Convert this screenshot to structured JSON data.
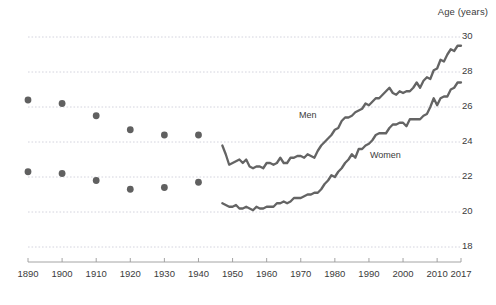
{
  "chart_data": {
    "type": "line",
    "title": "",
    "xlabel": "",
    "ylabel": "Age (years)",
    "ylim": [
      17.0,
      30.6
    ],
    "xlim": [
      1886,
      2020
    ],
    "grid": true,
    "legend_position": "inline-annotations",
    "yticks": [
      18,
      20,
      22,
      24,
      26,
      28,
      30
    ],
    "xticks": [
      1890,
      1900,
      1910,
      1920,
      1930,
      1940,
      1950,
      1960,
      1970,
      1980,
      1990,
      2000,
      2010,
      2017
    ],
    "annotations": [
      {
        "text": "Men",
        "x": 1972,
        "y": 25.4
      },
      {
        "text": "Women",
        "x": 1995,
        "y": 23.1
      }
    ],
    "series": [
      {
        "name": "Men",
        "kind": "scatter",
        "marker": "circle",
        "color": "#606060",
        "x": [
          1890,
          1900,
          1910,
          1920,
          1930,
          1940
        ],
        "values": [
          26.4,
          26.2,
          25.5,
          24.7,
          24.4,
          24.4
        ]
      },
      {
        "name": "Women",
        "kind": "scatter",
        "marker": "circle",
        "color": "#606060",
        "x": [
          1890,
          1900,
          1910,
          1920,
          1930,
          1940
        ],
        "values": [
          22.3,
          22.2,
          21.8,
          21.3,
          21.4,
          21.7
        ]
      },
      {
        "name": "Men",
        "kind": "line",
        "color": "#646464",
        "x": [
          1947,
          1948,
          1949,
          1950,
          1951,
          1952,
          1953,
          1954,
          1955,
          1956,
          1957,
          1958,
          1959,
          1960,
          1961,
          1962,
          1963,
          1964,
          1965,
          1966,
          1967,
          1968,
          1969,
          1970,
          1971,
          1972,
          1973,
          1974,
          1975,
          1976,
          1977,
          1978,
          1979,
          1980,
          1981,
          1982,
          1983,
          1984,
          1985,
          1986,
          1987,
          1988,
          1989,
          1990,
          1991,
          1992,
          1993,
          1994,
          1995,
          1996,
          1997,
          1998,
          1999,
          2000,
          2001,
          2002,
          2003,
          2004,
          2005,
          2006,
          2007,
          2008,
          2009,
          2010,
          2011,
          2012,
          2013,
          2014,
          2015,
          2016,
          2017
        ],
        "values": [
          23.8,
          23.3,
          22.7,
          22.8,
          22.9,
          23.0,
          22.8,
          23.0,
          22.6,
          22.5,
          22.6,
          22.6,
          22.5,
          22.8,
          22.8,
          22.7,
          22.8,
          23.1,
          22.8,
          22.8,
          23.1,
          23.1,
          23.2,
          23.2,
          23.1,
          23.3,
          23.2,
          23.1,
          23.5,
          23.8,
          24.0,
          24.2,
          24.4,
          24.7,
          24.8,
          25.2,
          25.4,
          25.4,
          25.5,
          25.7,
          25.8,
          25.9,
          26.2,
          26.1,
          26.3,
          26.5,
          26.5,
          26.7,
          26.9,
          27.1,
          26.8,
          26.7,
          26.9,
          26.8,
          26.9,
          26.9,
          27.1,
          27.4,
          27.1,
          27.5,
          27.7,
          27.6,
          28.1,
          28.2,
          28.7,
          28.6,
          29.0,
          29.3,
          29.2,
          29.5,
          29.5
        ]
      },
      {
        "name": "Women",
        "kind": "line",
        "color": "#646464",
        "x": [
          1947,
          1948,
          1949,
          1950,
          1951,
          1952,
          1953,
          1954,
          1955,
          1956,
          1957,
          1958,
          1959,
          1960,
          1961,
          1962,
          1963,
          1964,
          1965,
          1966,
          1967,
          1968,
          1969,
          1970,
          1971,
          1972,
          1973,
          1974,
          1975,
          1976,
          1977,
          1978,
          1979,
          1980,
          1981,
          1982,
          1983,
          1984,
          1985,
          1986,
          1987,
          1988,
          1989,
          1990,
          1991,
          1992,
          1993,
          1994,
          1995,
          1996,
          1997,
          1998,
          1999,
          2000,
          2001,
          2002,
          2003,
          2004,
          2005,
          2006,
          2007,
          2008,
          2009,
          2010,
          2011,
          2012,
          2013,
          2014,
          2015,
          2016,
          2017
        ],
        "values": [
          20.5,
          20.4,
          20.3,
          20.3,
          20.4,
          20.2,
          20.2,
          20.3,
          20.2,
          20.1,
          20.3,
          20.2,
          20.2,
          20.3,
          20.3,
          20.3,
          20.5,
          20.5,
          20.6,
          20.5,
          20.6,
          20.8,
          20.8,
          20.8,
          20.9,
          21.0,
          21.0,
          21.1,
          21.1,
          21.3,
          21.6,
          21.8,
          22.1,
          22.0,
          22.3,
          22.5,
          22.8,
          23.0,
          23.3,
          23.1,
          23.6,
          23.6,
          23.8,
          23.9,
          24.1,
          24.4,
          24.5,
          24.5,
          24.5,
          24.8,
          25.0,
          25.0,
          25.1,
          25.1,
          24.9,
          25.3,
          25.3,
          25.3,
          25.3,
          25.5,
          25.6,
          26.0,
          26.5,
          26.1,
          26.5,
          26.6,
          26.6,
          27.0,
          27.1,
          27.4,
          27.4
        ]
      }
    ]
  },
  "axis": {
    "y_title": "Age (years)"
  },
  "caption": {
    "text": ""
  }
}
